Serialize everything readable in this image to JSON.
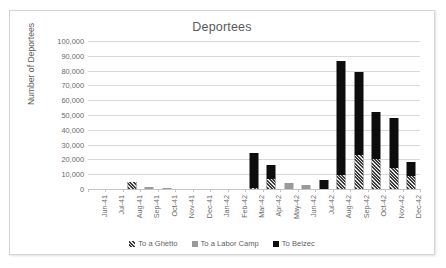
{
  "chart_data": {
    "type": "bar",
    "stacked": true,
    "title": "Deportees",
    "xlabel": "",
    "ylabel": "Number of Deportees",
    "ylim": [
      0,
      100000
    ],
    "ytick_step": 10000,
    "grid": true,
    "legend_position": "bottom",
    "ytick_labels": [
      "100,000",
      "90,000",
      "80,000",
      "70,000",
      "60,000",
      "50,000",
      "40,000",
      "30,000",
      "20,000",
      "10,000",
      "0"
    ],
    "categories": [
      "Jun-41",
      "Jul-41",
      "Aug-41",
      "Sep-41",
      "Oct-41",
      "Nov-41",
      "Dec-41",
      "Jan-42",
      "Feb-42",
      "Mar-42",
      "Apr-42",
      "May-42",
      "Jun-42",
      "Jul-42",
      "Aug-42",
      "Sep-42",
      "Oct-42",
      "Nov-42",
      "Dec-42"
    ],
    "series": [
      {
        "name": "To a Ghetto",
        "color": "#3d3d3d",
        "pattern": "hatch",
        "values": [
          0,
          0,
          5000,
          0,
          0,
          0,
          0,
          0,
          0,
          1000,
          7000,
          0,
          0,
          0,
          9500,
          23000,
          20000,
          14500,
          9000
        ]
      },
      {
        "name": "To a Labor Camp",
        "color": "#9a9a9a",
        "pattern": "solid",
        "values": [
          0,
          0,
          0,
          1200,
          900,
          0,
          0,
          0,
          0,
          0,
          0,
          4000,
          3000,
          0,
          0,
          0,
          0,
          0,
          0
        ]
      },
      {
        "name": "To Belzec",
        "color": "#0d0d0d",
        "pattern": "solid",
        "values": [
          0,
          0,
          0,
          0,
          0,
          0,
          0,
          0,
          0,
          23500,
          9000,
          0,
          0,
          6000,
          77000,
          56000,
          32000,
          33500,
          9000
        ]
      }
    ],
    "totals": [
      0,
      0,
      5000,
      1200,
      900,
      0,
      0,
      0,
      0,
      24500,
      16000,
      4000,
      3000,
      6000,
      86500,
      79000,
      52000,
      48000,
      18000
    ]
  },
  "legend": {
    "items": [
      {
        "label": "To a Ghetto",
        "swatch": "ghetto-swatch-icon"
      },
      {
        "label": "To a Labor Camp",
        "swatch": "labor-camp-swatch-icon"
      },
      {
        "label": "To Belzec",
        "swatch": "belzec-swatch-icon"
      }
    ]
  }
}
